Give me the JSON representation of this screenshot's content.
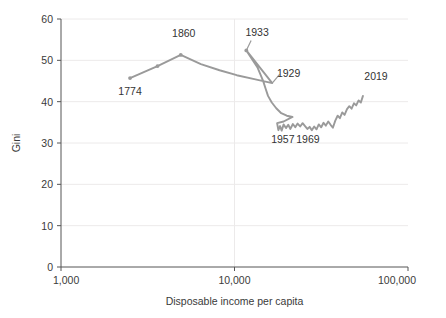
{
  "chart_data": {
    "type": "line",
    "title": "",
    "xlabel": "Disposable income per capita",
    "ylabel": "Gini",
    "xscale": "log",
    "xlim": [
      1000,
      100000
    ],
    "ylim": [
      0,
      60
    ],
    "xticks": [
      1000,
      10000,
      100000
    ],
    "xticklabels": [
      "1,000",
      "10,000",
      "100,000"
    ],
    "yticks": [
      0,
      10,
      20,
      30,
      40,
      50,
      60
    ],
    "yticklabels": [
      "0",
      "10",
      "20",
      "30",
      "40",
      "50",
      "60"
    ],
    "grid": true,
    "legend": "none",
    "series_name": "Gini vs disposable income per capita",
    "line_color": "#9a9a9a",
    "text_color": "#333333",
    "grid_color": "#eceaea",
    "axis_color": "#555555",
    "annotations": [
      {
        "label": "1774",
        "x": 2500,
        "y": 45.7,
        "label_x": 2500,
        "label_y": 41.5
      },
      {
        "label": "1860",
        "x": 4900,
        "y": 51.3,
        "label_x": 5100,
        "label_y": 55.6
      },
      {
        "label": "1933",
        "x": 11700,
        "y": 52.4,
        "label_x": 13500,
        "label_y": 56.0
      },
      {
        "label": "1929",
        "x": 16500,
        "y": 44.5,
        "label_x": 20500,
        "label_y": 45.9
      },
      {
        "label": "1957",
        "x": 18500,
        "y": 34.5,
        "label_x": 19000,
        "label_y": 30.0
      },
      {
        "label": "1969",
        "x": 25500,
        "y": 34.3,
        "label_x": 26500,
        "label_y": 30.0
      },
      {
        "label": "2019",
        "x": 55000,
        "y": 41.4,
        "label_x": 56000,
        "label_y": 45.3
      }
    ],
    "points": [
      [
        2500,
        45.7
      ],
      [
        3600,
        48.6
      ],
      [
        4900,
        51.3
      ],
      [
        6400,
        49.1
      ],
      [
        8200,
        47.6
      ],
      [
        10300,
        46.4
      ],
      [
        13200,
        45.4
      ],
      [
        16500,
        44.5
      ],
      [
        11700,
        52.4
      ],
      [
        13600,
        48.2
      ],
      [
        14600,
        45.1
      ],
      [
        15100,
        43.2
      ],
      [
        15600,
        41.4
      ],
      [
        16400,
        39.8
      ],
      [
        17400,
        38.4
      ],
      [
        18600,
        37.2
      ],
      [
        20000,
        36.6
      ],
      [
        21600,
        36.3
      ],
      [
        19200,
        35.2
      ],
      [
        17600,
        34.8
      ],
      [
        17900,
        33.1
      ],
      [
        18300,
        34.1
      ],
      [
        18700,
        33.0
      ],
      [
        19200,
        34.5
      ],
      [
        19800,
        33.6
      ],
      [
        20400,
        34.4
      ],
      [
        21000,
        33.4
      ],
      [
        21700,
        34.6
      ],
      [
        22400,
        33.8
      ],
      [
        23100,
        34.7
      ],
      [
        23900,
        34.0
      ],
      [
        24700,
        34.8
      ],
      [
        25500,
        34.1
      ],
      [
        26300,
        33.4
      ],
      [
        27100,
        33.9
      ],
      [
        27900,
        33.1
      ],
      [
        28800,
        34.0
      ],
      [
        29700,
        33.3
      ],
      [
        30600,
        34.5
      ],
      [
        31600,
        33.8
      ],
      [
        32600,
        34.9
      ],
      [
        33600,
        34.2
      ],
      [
        34700,
        35.2
      ],
      [
        35800,
        34.4
      ],
      [
        36900,
        33.7
      ],
      [
        38100,
        35.4
      ],
      [
        39300,
        36.6
      ],
      [
        40500,
        36.0
      ],
      [
        41800,
        37.4
      ],
      [
        43100,
        36.8
      ],
      [
        44500,
        38.2
      ],
      [
        45900,
        38.9
      ],
      [
        47300,
        38.3
      ],
      [
        48800,
        39.6
      ],
      [
        50300,
        39.1
      ],
      [
        51900,
        40.3
      ],
      [
        53500,
        39.8
      ],
      [
        55000,
        41.4
      ]
    ]
  }
}
